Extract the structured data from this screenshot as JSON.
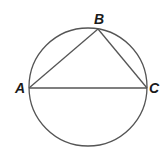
{
  "diagram": {
    "circle": {
      "cx": 88,
      "cy": 87,
      "r": 59,
      "stroke": "#555555"
    },
    "points": {
      "A": {
        "label": "A",
        "x": 29,
        "y": 88,
        "lx": 15,
        "ly": 93
      },
      "B": {
        "label": "B",
        "x": 98,
        "y": 29,
        "lx": 94,
        "ly": 24
      },
      "C": {
        "label": "C",
        "x": 147,
        "y": 88,
        "lx": 149,
        "ly": 93
      }
    },
    "segments": [
      {
        "name": "segment-ab",
        "from": "A",
        "to": "B"
      },
      {
        "name": "segment-bc",
        "from": "B",
        "to": "C"
      },
      {
        "name": "segment-ac",
        "from": "A",
        "to": "C"
      }
    ],
    "line_color": "#555555"
  }
}
